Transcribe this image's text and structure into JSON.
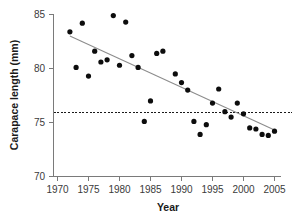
{
  "chart_data": {
    "type": "scatter",
    "title": "",
    "xlabel": "Year",
    "ylabel": "Carapace length (mm)",
    "xlim": [
      1969,
      2006
    ],
    "ylim": [
      70,
      85
    ],
    "xticks": [
      1970,
      1975,
      1980,
      1985,
      1990,
      1995,
      2000,
      2005
    ],
    "yticks": [
      70,
      75,
      80,
      85
    ],
    "grid": false,
    "legend": "none",
    "point_color": "#0d0d0d",
    "trend_color": "#8c8c8c",
    "reference_line_color": "#1a1a1a",
    "x": [
      1972,
      1973,
      1974,
      1975,
      1976,
      1977,
      1978,
      1979,
      1980,
      1981,
      1982,
      1983,
      1984,
      1985,
      1986,
      1987,
      1989,
      1990,
      1991,
      1992,
      1993,
      1994,
      1995,
      1996,
      1997,
      1998,
      1999,
      2000,
      2001,
      2002,
      2003,
      2004,
      2005
    ],
    "y": [
      83.4,
      80.1,
      84.2,
      79.3,
      81.6,
      80.6,
      80.8,
      84.9,
      80.3,
      84.3,
      81.2,
      80.1,
      75.1,
      77.0,
      81.4,
      81.6,
      79.5,
      78.7,
      78.0,
      75.1,
      73.9,
      74.8,
      76.8,
      78.1,
      76.0,
      75.5,
      76.8,
      75.8,
      74.5,
      74.4,
      73.9,
      73.8,
      74.2
    ],
    "trend": {
      "label": "linear regression line",
      "x_start": 1972,
      "y_start": 83.0,
      "x_end": 2005,
      "y_end": 74.3
    },
    "reference": {
      "label": "horizontal reference line",
      "y": 75.9
    }
  }
}
